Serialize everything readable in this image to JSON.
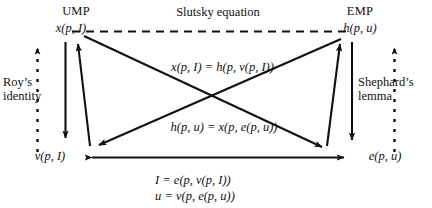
{
  "figure": {
    "type": "economic-duality-diagram",
    "background_color": "#ffffff",
    "line_color": "#111111",
    "text_color": "#111111"
  },
  "nodes": {
    "ump_title": "UMP",
    "ump_function": "x(p, I)",
    "emp_title": "EMP",
    "emp_function": "h(p, u)",
    "indirect_utility": "v(p, I)",
    "expenditure": "e(p, u)"
  },
  "edge_labels": {
    "top_dashed": "Slutsky equation",
    "left_dashed": "Roy’s\nidentity",
    "left_dashed_line1": "Roy’s",
    "left_dashed_line2": "identity",
    "right_dashed_line1": "Shephard’s",
    "right_dashed_line2": "lemma",
    "diagonal_upper": "x(p, I) = h(p, v(p, I))",
    "diagonal_lower": "h(p, u) = x(p, e(p, u))",
    "bottom_line1": "I = e(p, v(p, I))",
    "bottom_line2": "u = v(p, e(p, u))"
  },
  "arrows": [
    {
      "name": "slutsky-dashed-arrow",
      "style": "dashed",
      "from": "x(p, I)",
      "to": "h(p, u)",
      "heads": "none"
    },
    {
      "name": "roys-identity-dashed-arrow",
      "style": "dashed",
      "from": "v(p, I)",
      "to": "x(p, I)",
      "heads": "up"
    },
    {
      "name": "shephards-lemma-dashed-arrow",
      "style": "dashed",
      "from": "e(p, u)",
      "to": "h(p, u)",
      "heads": "up"
    },
    {
      "name": "ump-down-arrow",
      "style": "solid",
      "from": "x(p, I)",
      "to": "v(p, I)",
      "heads": "down"
    },
    {
      "name": "ump-up-arrow",
      "style": "solid",
      "from": "v(p, I)",
      "to": "x(p, I)",
      "heads": "up"
    },
    {
      "name": "emp-down-arrow",
      "style": "solid",
      "from": "h(p, u)",
      "to": "e(p, u)",
      "heads": "down"
    },
    {
      "name": "emp-up-arrow",
      "style": "solid",
      "from": "e(p, u)",
      "to": "h(p, u)",
      "heads": "up"
    },
    {
      "name": "diagonal-ump-to-expenditure-arrow",
      "style": "solid",
      "from": "x(p, I)",
      "to": "e(p, u)",
      "heads": "end"
    },
    {
      "name": "diagonal-emp-to-indirect-utility-arrow",
      "style": "solid",
      "from": "h(p, u)",
      "to": "v(p, I)",
      "heads": "end"
    },
    {
      "name": "bottom-double-arrow",
      "style": "solid",
      "from": "v(p, I)",
      "to": "e(p, u)",
      "heads": "both"
    }
  ]
}
